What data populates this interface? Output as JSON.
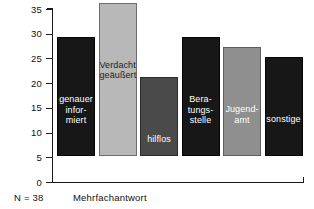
{
  "chart_data": {
    "type": "bar",
    "title": "",
    "subtitle": "",
    "xlabel": "",
    "ylabel": "",
    "ylim": [
      0,
      35
    ],
    "ytick_step": 5,
    "yticks": [
      0,
      5,
      10,
      15,
      20,
      25,
      30,
      35
    ],
    "ytick_labels": [
      "0",
      "5",
      "10",
      "15",
      "20",
      "25",
      "30",
      "35"
    ],
    "grid": false,
    "legend": false,
    "legend_position": "none",
    "categories": [
      "genauer informiert",
      "Verdacht geäußert",
      "hilflos",
      "Beratungsstelle",
      "Jugendamt",
      "sonstige"
    ],
    "category_labels_multiline": [
      "genauer\ninfor-\nmiert",
      "Verdacht\ngeäußert",
      "hilflos",
      "Bera-\ntungs-\nstelle",
      "Jugend-\namt",
      "sonstige"
    ],
    "values": [
      24,
      31,
      16,
      24,
      22,
      20
    ],
    "bar_colors": [
      "#171717",
      "#b8b8b8",
      "#4a4a4a",
      "#171717",
      "#8f8f8f",
      "#171717"
    ],
    "bar_label_colors": [
      "#ffffff",
      "#1c1c1c",
      "#ffffff",
      "#ffffff",
      "#ffffff",
      "#ffffff"
    ],
    "annotations": [
      "N = 38",
      "Mehrfachantwort"
    ]
  },
  "axis": {
    "ticks": [
      {
        "value": 35,
        "label": "35"
      },
      {
        "value": 30,
        "label": "30"
      },
      {
        "value": 25,
        "label": "25"
      },
      {
        "value": 20,
        "label": "20"
      },
      {
        "value": 15,
        "label": "15"
      },
      {
        "value": 10,
        "label": "10"
      },
      {
        "value": 5,
        "label": "5"
      },
      {
        "value": 0,
        "label": "0"
      }
    ]
  },
  "footnotes": {
    "sample_size": "N = 38",
    "multiple_answers": "Mehrfachantwort"
  },
  "colors": {
    "axis": "#1a1a1a",
    "background": "#ffffff",
    "bar_dark": "#171717",
    "bar_light": "#b8b8b8",
    "bar_mid": "#4a4a4a",
    "bar_grey": "#8f8f8f"
  }
}
